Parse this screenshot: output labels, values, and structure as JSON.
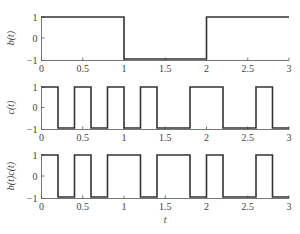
{
  "chart_data": [
    {
      "type": "line",
      "title": "",
      "ylabel": "b(t)",
      "xlabel": "",
      "xlim": [
        0,
        3
      ],
      "ylim": [
        -1,
        1
      ],
      "xticks": [
        "0",
        "0.5",
        "1",
        "1.5",
        "2",
        "2.5",
        "3"
      ],
      "yticks": [
        "1",
        "0",
        "−1"
      ],
      "grid": false,
      "step": true,
      "x": [
        0,
        1,
        1,
        2,
        2,
        3
      ],
      "values": [
        1,
        1,
        -1,
        -1,
        1,
        1
      ]
    },
    {
      "type": "line",
      "title": "",
      "ylabel": "c(t)",
      "xlabel": "",
      "xlim": [
        0,
        3
      ],
      "ylim": [
        -1,
        1
      ],
      "xticks": [
        "0",
        "0.5",
        "1",
        "1.5",
        "2",
        "2.5",
        "3"
      ],
      "yticks": [
        "1",
        "0",
        "−1"
      ],
      "grid": false,
      "step": true,
      "x": [
        0,
        0.2,
        0.2,
        0.4,
        0.4,
        0.6,
        0.6,
        0.8,
        0.8,
        1.0,
        1.0,
        1.2,
        1.2,
        1.4,
        1.4,
        1.8,
        1.8,
        2.2,
        2.2,
        2.6,
        2.6,
        2.8,
        2.8,
        3.0
      ],
      "values": [
        1,
        1,
        -1,
        -1,
        1,
        1,
        -1,
        -1,
        1,
        1,
        -1,
        -1,
        1,
        1,
        -1,
        -1,
        1,
        1,
        -1,
        -1,
        1,
        1,
        -1,
        -1
      ]
    },
    {
      "type": "line",
      "title": "",
      "ylabel": "b(t)c(t)",
      "xlabel": "t",
      "xlim": [
        0,
        3
      ],
      "ylim": [
        -1,
        1
      ],
      "xticks": [
        "0",
        "0.5",
        "1",
        "1.5",
        "2",
        "2.5",
        "3"
      ],
      "yticks": [
        "1",
        "0",
        "−1"
      ],
      "grid": false,
      "step": true,
      "x": [
        0,
        0.2,
        0.2,
        0.4,
        0.4,
        0.6,
        0.6,
        0.8,
        0.8,
        1.2,
        1.2,
        1.4,
        1.4,
        1.8,
        1.8,
        2.0,
        2.0,
        2.2,
        2.2,
        2.6,
        2.6,
        2.8,
        2.8,
        3.0
      ],
      "values": [
        1,
        1,
        -1,
        -1,
        1,
        1,
        -1,
        -1,
        1,
        1,
        -1,
        -1,
        1,
        1,
        -1,
        -1,
        1,
        1,
        -1,
        -1,
        1,
        1,
        -1,
        -1
      ]
    }
  ]
}
